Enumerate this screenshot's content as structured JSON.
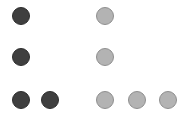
{
  "colors": {
    "dark": "#3f3f3f",
    "light": "#b3b3b3"
  },
  "rows": [
    {
      "dark_count": 1,
      "light_count": 1
    },
    {
      "dark_count": 1,
      "light_count": 1
    },
    {
      "dark_count": 2,
      "light_count": 3
    }
  ],
  "dots": [
    {
      "type": "dark",
      "cx": 21,
      "cy": 16
    },
    {
      "type": "light",
      "cx": 105,
      "cy": 16
    },
    {
      "type": "dark",
      "cx": 21,
      "cy": 57
    },
    {
      "type": "light",
      "cx": 105,
      "cy": 57
    },
    {
      "type": "dark",
      "cx": 21,
      "cy": 100
    },
    {
      "type": "dark",
      "cx": 50,
      "cy": 100
    },
    {
      "type": "light",
      "cx": 105,
      "cy": 100
    },
    {
      "type": "light",
      "cx": 137,
      "cy": 100
    },
    {
      "type": "light",
      "cx": 168,
      "cy": 100
    }
  ]
}
